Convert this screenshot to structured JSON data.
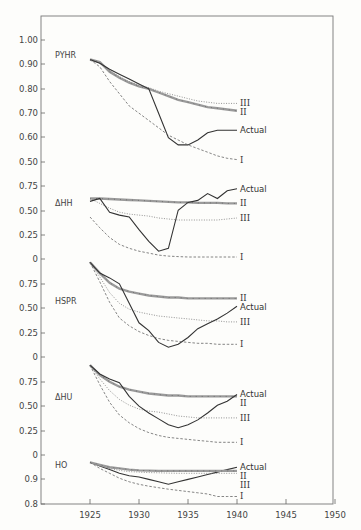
{
  "chart_data": {
    "type": "line",
    "title": "",
    "xlabel": "",
    "ylabel": "",
    "x_ticks": [
      1925,
      1930,
      1935,
      1940,
      1945,
      1950
    ],
    "xlim": [
      1920,
      1950
    ],
    "grid": false,
    "legend_position": "inline labels at right end of each series",
    "series_styles": {
      "Actual": "solid",
      "I": "dashed",
      "II": "thick marked line",
      "III": "dotted"
    },
    "panels": [
      {
        "name": "PYHR",
        "y_ticks": [
          "1.00",
          "0.90",
          "0.80",
          "0.70",
          "0.60",
          "0.50"
        ],
        "ylim": [
          0.5,
          1.0
        ],
        "x": [
          1925,
          1926,
          1927,
          1928,
          1929,
          1930,
          1931,
          1932,
          1933,
          1934,
          1935,
          1936,
          1937,
          1938,
          1939,
          1940
        ],
        "series": [
          {
            "name": "II",
            "values": [
              0.92,
              0.91,
              0.87,
              0.845,
              0.825,
              0.81,
              0.8,
              0.785,
              0.77,
              0.755,
              0.745,
              0.735,
              0.725,
              0.72,
              0.715,
              0.71
            ]
          },
          {
            "name": "III",
            "values": [
              0.92,
              0.905,
              0.875,
              0.85,
              0.83,
              0.815,
              0.805,
              0.79,
              0.78,
              0.77,
              0.76,
              0.75,
              0.745,
              0.74,
              0.74,
              0.74
            ]
          },
          {
            "name": "Actual",
            "values": [
              0.92,
              0.905,
              0.88,
              0.86,
              0.84,
              0.82,
              0.8,
              0.7,
              0.6,
              0.57,
              0.57,
              0.59,
              0.62,
              0.63,
              0.63,
              0.63
            ]
          },
          {
            "name": "I",
            "values": [
              0.92,
              0.89,
              0.83,
              0.78,
              0.73,
              0.7,
              0.67,
              0.64,
              0.61,
              0.59,
              0.57,
              0.555,
              0.54,
              0.525,
              0.515,
              0.51
            ]
          }
        ]
      },
      {
        "name": "ΔHH",
        "y_ticks": [
          "0.75",
          "0.50",
          "0.25",
          "0"
        ],
        "ylim": [
          0,
          0.75
        ],
        "x": [
          1925,
          1926,
          1927,
          1928,
          1929,
          1930,
          1931,
          1932,
          1933,
          1934,
          1935,
          1936,
          1937,
          1938,
          1939,
          1940
        ],
        "series": [
          {
            "name": "II",
            "values": [
              0.62,
              0.62,
              0.615,
              0.61,
              0.605,
              0.6,
              0.595,
              0.59,
              0.585,
              0.58,
              0.58,
              0.575,
              0.575,
              0.575,
              0.57,
              0.57
            ]
          },
          {
            "name": "III",
            "values": [
              0.62,
              0.57,
              0.52,
              0.48,
              0.46,
              0.45,
              0.44,
              0.42,
              0.41,
              0.4,
              0.4,
              0.4,
              0.4,
              0.4,
              0.41,
              0.42
            ]
          },
          {
            "name": "Actual",
            "values": [
              0.59,
              0.62,
              0.48,
              0.45,
              0.43,
              0.3,
              0.18,
              0.08,
              0.11,
              0.5,
              0.58,
              0.6,
              0.67,
              0.62,
              0.7,
              0.72
            ]
          },
          {
            "name": "I",
            "values": [
              0.43,
              0.32,
              0.22,
              0.15,
              0.11,
              0.08,
              0.06,
              0.04,
              0.03,
              0.025,
              0.02,
              0.02,
              0.02,
              0.02,
              0.02,
              0.02
            ]
          }
        ]
      },
      {
        "name": "HSPR",
        "y_ticks": [
          "0.75",
          "0.50",
          "0.25",
          "0"
        ],
        "ylim": [
          0,
          0.75
        ],
        "x": [
          1925,
          1926,
          1927,
          1928,
          1929,
          1930,
          1931,
          1932,
          1933,
          1934,
          1935,
          1936,
          1937,
          1938,
          1939,
          1940
        ],
        "series": [
          {
            "name": "II",
            "values": [
              0.97,
              0.86,
              0.76,
              0.7,
              0.67,
              0.65,
              0.63,
              0.62,
              0.61,
              0.61,
              0.6,
              0.6,
              0.6,
              0.6,
              0.6,
              0.6
            ]
          },
          {
            "name": "III",
            "values": [
              0.97,
              0.82,
              0.66,
              0.55,
              0.49,
              0.46,
              0.44,
              0.42,
              0.41,
              0.4,
              0.39,
              0.38,
              0.37,
              0.37,
              0.36,
              0.36
            ]
          },
          {
            "name": "Actual",
            "values": [
              0.97,
              0.86,
              0.81,
              0.75,
              0.55,
              0.35,
              0.27,
              0.15,
              0.1,
              0.13,
              0.2,
              0.29,
              0.34,
              0.39,
              0.45,
              0.52
            ]
          },
          {
            "name": "I",
            "values": [
              0.97,
              0.77,
              0.56,
              0.4,
              0.32,
              0.26,
              0.22,
              0.19,
              0.17,
              0.16,
              0.15,
              0.14,
              0.14,
              0.13,
              0.13,
              0.13
            ]
          }
        ]
      },
      {
        "name": "ΔHU",
        "y_ticks": [
          "0.75",
          "0.50",
          "0.25",
          "0"
        ],
        "ylim": [
          0,
          0.75
        ],
        "x": [
          1925,
          1926,
          1927,
          1928,
          1929,
          1930,
          1931,
          1932,
          1933,
          1934,
          1935,
          1936,
          1937,
          1938,
          1939,
          1940
        ],
        "series": [
          {
            "name": "II",
            "values": [
              0.92,
              0.82,
              0.75,
              0.7,
              0.67,
              0.65,
              0.63,
              0.62,
              0.61,
              0.61,
              0.6,
              0.6,
              0.6,
              0.6,
              0.6,
              0.6
            ]
          },
          {
            "name": "III",
            "values": [
              0.92,
              0.78,
              0.66,
              0.57,
              0.51,
              0.47,
              0.45,
              0.44,
              0.42,
              0.4,
              0.39,
              0.38,
              0.38,
              0.38,
              0.38,
              0.38
            ]
          },
          {
            "name": "Actual",
            "values": [
              0.92,
              0.83,
              0.78,
              0.74,
              0.6,
              0.5,
              0.43,
              0.37,
              0.31,
              0.28,
              0.31,
              0.36,
              0.43,
              0.51,
              0.55,
              0.62
            ]
          },
          {
            "name": "I",
            "values": [
              0.92,
              0.72,
              0.54,
              0.41,
              0.33,
              0.27,
              0.23,
              0.2,
              0.18,
              0.17,
              0.16,
              0.15,
              0.14,
              0.13,
              0.13,
              0.13
            ]
          }
        ]
      },
      {
        "name": "HO",
        "y_ticks": [
          "0",
          "0.9",
          "0.8"
        ],
        "ylim": [
          0.8,
          1.0
        ],
        "x": [
          1925,
          1926,
          1927,
          1928,
          1929,
          1930,
          1931,
          1932,
          1933,
          1934,
          1935,
          1936,
          1937,
          1938,
          1939,
          1940
        ],
        "series": [
          {
            "name": "Actual",
            "values": [
              0.97,
              0.955,
              0.94,
              0.925,
              0.915,
              0.91,
              0.9,
              0.89,
              0.88,
              0.89,
              0.9,
              0.91,
              0.92,
              0.93,
              0.94,
              0.95
            ]
          },
          {
            "name": "II",
            "values": [
              0.97,
              0.96,
              0.95,
              0.945,
              0.94,
              0.937,
              0.936,
              0.935,
              0.935,
              0.935,
              0.935,
              0.935,
              0.935,
              0.935,
              0.935,
              0.935
            ]
          },
          {
            "name": "III",
            "values": [
              0.97,
              0.955,
              0.945,
              0.937,
              0.932,
              0.93,
              0.928,
              0.927,
              0.926,
              0.925,
              0.925,
              0.925,
              0.925,
              0.925,
              0.925,
              0.925
            ]
          },
          {
            "name": "I",
            "values": [
              0.97,
              0.945,
              0.925,
              0.905,
              0.89,
              0.88,
              0.872,
              0.866,
              0.86,
              0.855,
              0.85,
              0.845,
              0.84,
              0.83,
              0.83,
              0.83
            ]
          }
        ]
      }
    ]
  },
  "labels": {
    "panel_names": [
      "PYHR",
      "ΔHH",
      "HSPR",
      "ΔHU",
      "HO"
    ],
    "actual": "Actual",
    "roman_I": "I",
    "roman_II": "II",
    "roman_III": "III"
  },
  "colors": {
    "background": "#fdfdfb",
    "ink": "#333333",
    "axis": "#555555",
    "series_II_fill": "#9a9a9a"
  }
}
